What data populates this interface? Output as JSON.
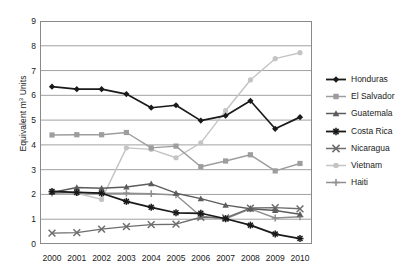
{
  "chart_data": {
    "type": "line",
    "title": "",
    "xlabel": "",
    "ylabel": "Equivalent m3 Units",
    "ylabel_base": "Equivalent m",
    "ylabel_sup": "3",
    "ylabel_tail": " Units",
    "categories": [
      "2000",
      "2001",
      "2002",
      "2003",
      "2004",
      "2005",
      "2006",
      "2007",
      "2008",
      "2009",
      "2010"
    ],
    "x": [
      2000,
      2001,
      2002,
      2003,
      2004,
      2005,
      2006,
      2007,
      2008,
      2009,
      2010
    ],
    "ylim": [
      0,
      9
    ],
    "xlim": [
      2000,
      2010
    ],
    "yticks": [
      0,
      1,
      2,
      3,
      4,
      5,
      6,
      7,
      8,
      9
    ],
    "grid": "horizontal",
    "legend_position": "right",
    "series": [
      {
        "name": "Honduras",
        "color": "#1a1a1a",
        "marker": "diamond",
        "values": [
          6.35,
          6.25,
          6.25,
          6.05,
          5.5,
          5.6,
          4.98,
          5.18,
          5.78,
          4.65,
          5.12
        ]
      },
      {
        "name": "El Salvador",
        "color": "#9d9d9d",
        "marker": "square",
        "values": [
          4.4,
          4.41,
          4.41,
          4.5,
          3.88,
          3.95,
          3.12,
          3.35,
          3.6,
          2.95,
          3.25
        ]
      },
      {
        "name": "Guatemala",
        "color": "#5c5c5c",
        "marker": "triangle",
        "values": [
          2.08,
          2.28,
          2.25,
          2.3,
          2.43,
          2.05,
          1.83,
          1.57,
          1.42,
          1.35,
          1.2
        ]
      },
      {
        "name": "Costa Rica",
        "color": "#1a1a1a",
        "marker": "star",
        "values": [
          2.12,
          2.08,
          2.05,
          1.72,
          1.48,
          1.26,
          1.24,
          1.02,
          0.76,
          0.4,
          0.22
        ]
      },
      {
        "name": "Nicaragua",
        "color": "#6e6e6e",
        "marker": "cross-x",
        "values": [
          0.44,
          0.46,
          0.6,
          0.7,
          0.78,
          0.8,
          1.08,
          1.05,
          1.45,
          1.47,
          1.42
        ]
      },
      {
        "name": "Vietnam",
        "color": "#c4c4c4",
        "marker": "circle",
        "values": [
          2.12,
          2.05,
          1.8,
          3.88,
          3.82,
          3.48,
          4.08,
          5.38,
          6.62,
          7.48,
          7.72
        ]
      },
      {
        "name": "Haiti",
        "color": "#8f8f8f",
        "marker": "plus",
        "values": [
          2.05,
          2.08,
          2.05,
          2.05,
          2.03,
          1.98,
          1.12,
          1.02,
          1.42,
          1.05,
          1.1
        ]
      }
    ]
  }
}
